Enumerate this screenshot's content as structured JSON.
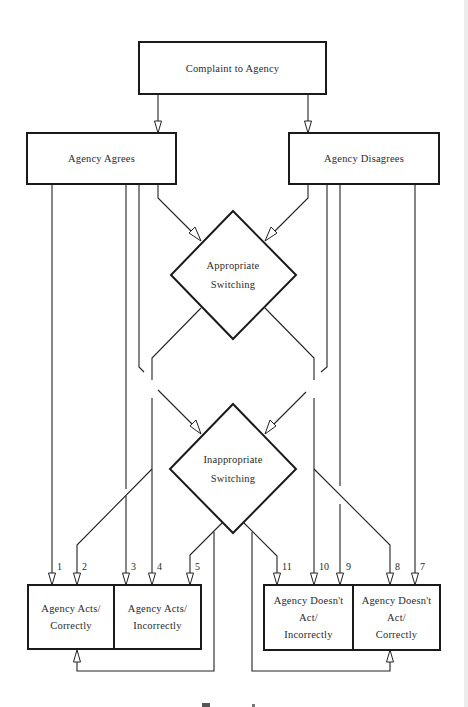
{
  "diagram": {
    "nodes": {
      "complaint": {
        "label": "Complaint to Agency"
      },
      "agrees": {
        "label": "Agency Agrees"
      },
      "disagrees": {
        "label": "Agency Disagrees"
      },
      "appropriate": {
        "line1": "Appropriate",
        "line2": "Switching"
      },
      "inappropriate": {
        "line1": "Inappropriate",
        "line2": "Switching"
      },
      "acts_correctly": {
        "line1": "Agency Acts/",
        "line2": "Correctly"
      },
      "acts_incorrectly": {
        "line1": "Agency Acts/",
        "line2": "Incorrectly"
      },
      "doesnt_act_incorrectly": {
        "line1": "Agency Doesn't",
        "line2": "Act/",
        "line3": "Incorrectly"
      },
      "doesnt_act_correctly": {
        "line1": "Agency Doesn't",
        "line2": "Act/",
        "line3": "Correctly"
      }
    },
    "path_numbers": [
      "1",
      "2",
      "3",
      "4",
      "5",
      "7",
      "8",
      "9",
      "10",
      "11"
    ],
    "edges": [
      {
        "from": "Complaint to Agency",
        "to": "Agency Agrees"
      },
      {
        "from": "Complaint to Agency",
        "to": "Agency Disagrees"
      },
      {
        "from": "Agency Agrees",
        "to": "Appropriate Switching"
      },
      {
        "from": "Agency Disagrees",
        "to": "Appropriate Switching"
      },
      {
        "from": "Agency Agrees",
        "to": "Inappropriate Switching"
      },
      {
        "from": "Agency Disagrees",
        "to": "Inappropriate Switching"
      },
      {
        "path": "1",
        "from": "Agency Agrees",
        "to": "Agency Acts/Correctly"
      },
      {
        "path": "2",
        "from": "Inappropriate Switching",
        "to": "Agency Acts/Correctly"
      },
      {
        "path": "3",
        "from": "Agency Agrees",
        "to": "Agency Acts/Incorrectly"
      },
      {
        "path": "4",
        "from": "Appropriate Switching",
        "to": "Agency Acts/Incorrectly"
      },
      {
        "path": "5",
        "from": "Inappropriate Switching",
        "to": "Agency Acts/Incorrectly"
      },
      {
        "path": "11",
        "from": "Inappropriate Switching",
        "to": "Agency Doesn't Act/Incorrectly"
      },
      {
        "path": "10",
        "from": "Appropriate Switching",
        "to": "Agency Doesn't Act/Incorrectly"
      },
      {
        "path": "9",
        "from": "Agency Disagrees",
        "to": "Agency Doesn't Act/Incorrectly"
      },
      {
        "path": "8",
        "from": "Inappropriate Switching",
        "to": "Agency Doesn't Act/Correctly"
      },
      {
        "path": "7",
        "from": "Agency Disagrees",
        "to": "Agency Doesn't Act/Correctly"
      },
      {
        "from": "Inappropriate Switching",
        "to": "Agency Acts/Correctly",
        "note": "feedback loop"
      },
      {
        "from": "Inappropriate Switching",
        "to": "Agency Doesn't Act/Correctly",
        "note": "feedback loop"
      }
    ],
    "colors": {
      "line": "#222222",
      "background": "#ffffff"
    }
  }
}
